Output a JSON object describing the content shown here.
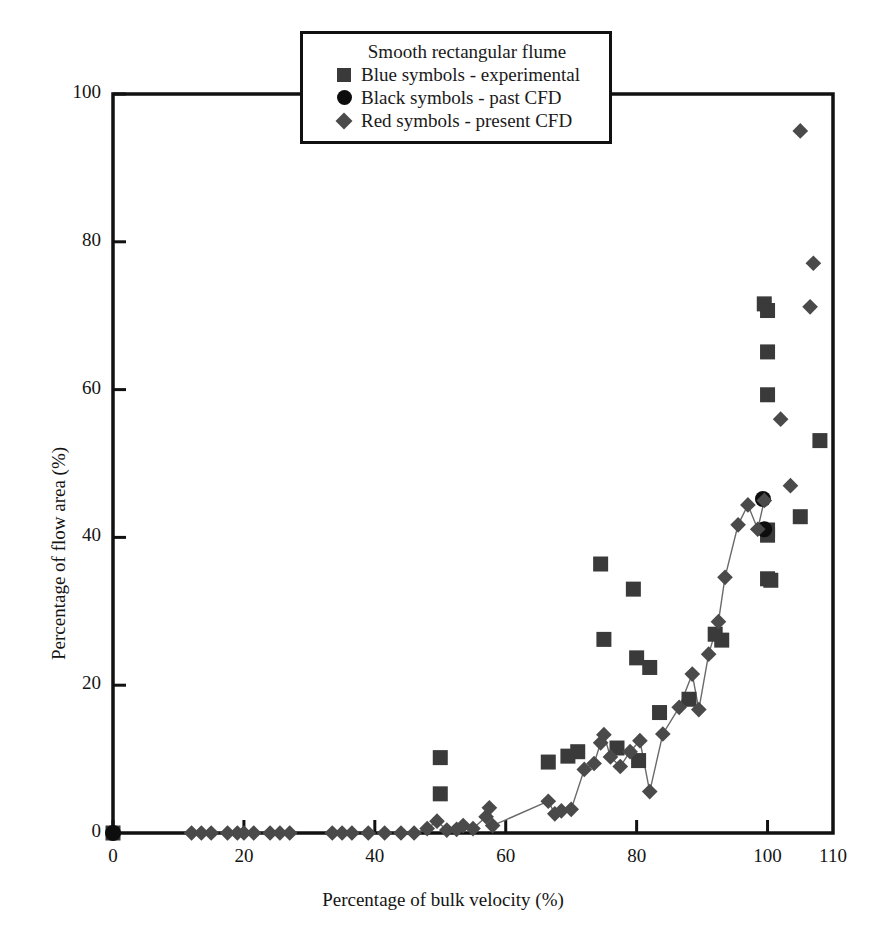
{
  "figure": {
    "background": "#ffffff",
    "width": 886,
    "height": 934
  },
  "legend": {
    "title": "Smooth rectangular flume",
    "entries": [
      {
        "marker": "square",
        "label": "Blue symbols - experimental",
        "color": "#3a3a3a"
      },
      {
        "marker": "circle",
        "label": "Black symbols - past CFD",
        "color": "#0d0d0d"
      },
      {
        "marker": "diamond",
        "label": "Red symbols - present CFD",
        "color": "#4a4a4a"
      }
    ]
  },
  "chart_data": {
    "type": "scatter",
    "title": "",
    "xlabel": "Percentage of bulk velocity (%)",
    "ylabel": "Percentage of flow area (%)",
    "xlim": [
      0,
      110
    ],
    "ylim": [
      0,
      100
    ],
    "xticks": [
      0,
      20,
      40,
      60,
      80,
      100,
      110
    ],
    "yticks": [
      0,
      20,
      40,
      60,
      80,
      100
    ],
    "xticklabels": [
      "0",
      "20",
      "40",
      "60",
      "80",
      "100",
      "110"
    ],
    "yticklabels": [
      "0",
      "20",
      "40",
      "60",
      "80",
      "100"
    ],
    "grid": false,
    "legend_position": "top-center",
    "series": [
      {
        "name": "Blue symbols - experimental",
        "marker": "square",
        "color": "#3a3a3a",
        "size": 15,
        "line": false,
        "points": [
          [
            0.0,
            0.0
          ],
          [
            50.0,
            10.2
          ],
          [
            50.0,
            5.3
          ],
          [
            66.5,
            9.6
          ],
          [
            69.5,
            10.4
          ],
          [
            71.0,
            11.0
          ],
          [
            74.5,
            36.4
          ],
          [
            75.0,
            26.2
          ],
          [
            77.0,
            11.5
          ],
          [
            79.5,
            33.0
          ],
          [
            80.0,
            23.7
          ],
          [
            80.3,
            9.8
          ],
          [
            82.0,
            22.4
          ],
          [
            83.5,
            16.3
          ],
          [
            88.0,
            18.1
          ],
          [
            92.0,
            26.9
          ],
          [
            93.0,
            26.1
          ],
          [
            99.5,
            71.6
          ],
          [
            100.0,
            70.7
          ],
          [
            100.0,
            65.1
          ],
          [
            100.0,
            59.3
          ],
          [
            100.0,
            41.0
          ],
          [
            100.0,
            40.3
          ],
          [
            100.0,
            34.4
          ],
          [
            100.5,
            34.2
          ],
          [
            105.0,
            42.8
          ],
          [
            108.0,
            53.1
          ]
        ]
      },
      {
        "name": "Black symbols - past CFD",
        "marker": "circle",
        "color": "#0d0d0d",
        "size": 16,
        "line": false,
        "points": [
          [
            0.0,
            0.0
          ],
          [
            99.3,
            45.2
          ],
          [
            99.5,
            41.1
          ]
        ]
      },
      {
        "name": "Red symbols - present CFD",
        "marker": "diamond",
        "color": "#4a4a4a",
        "size": 14,
        "line": true,
        "line_color": "#6a6a6a",
        "points": [
          [
            12.0,
            0.0
          ],
          [
            13.5,
            0.0
          ],
          [
            15.0,
            0.0
          ],
          [
            17.5,
            0.0
          ],
          [
            19.0,
            0.0
          ],
          [
            20.0,
            0.0
          ],
          [
            21.5,
            0.0
          ],
          [
            24.0,
            0.0
          ],
          [
            25.5,
            0.0
          ],
          [
            27.0,
            0.0
          ],
          [
            33.5,
            0.0
          ],
          [
            35.0,
            0.0
          ],
          [
            36.5,
            0.0
          ],
          [
            39.0,
            0.0
          ],
          [
            41.5,
            0.0
          ],
          [
            44.0,
            0.0
          ],
          [
            46.0,
            0.0
          ],
          [
            48.0,
            0.6
          ],
          [
            49.5,
            1.6
          ],
          [
            51.0,
            0.4
          ],
          [
            52.5,
            0.5
          ],
          [
            53.5,
            1.0
          ],
          [
            55.0,
            0.6
          ],
          [
            57.0,
            2.2
          ],
          [
            57.5,
            3.4
          ],
          [
            58.0,
            1.0
          ],
          [
            66.5,
            4.3
          ],
          [
            67.5,
            2.6
          ],
          [
            68.5,
            3.0
          ],
          [
            70.0,
            3.2
          ],
          [
            72.0,
            8.6
          ],
          [
            73.5,
            9.4
          ],
          [
            74.5,
            12.2
          ],
          [
            75.0,
            13.3
          ],
          [
            76.0,
            10.3
          ],
          [
            77.5,
            9.0
          ],
          [
            79.0,
            11.0
          ],
          [
            80.5,
            12.5
          ],
          [
            82.0,
            5.6
          ],
          [
            84.0,
            13.4
          ],
          [
            86.5,
            17.0
          ],
          [
            88.5,
            21.5
          ],
          [
            89.5,
            16.7
          ],
          [
            91.0,
            24.2
          ],
          [
            92.5,
            28.6
          ],
          [
            93.5,
            34.6
          ],
          [
            95.5,
            41.7
          ],
          [
            97.0,
            44.4
          ],
          [
            98.5,
            41.1
          ],
          [
            99.5,
            45.0
          ],
          [
            102.0,
            56.0
          ],
          [
            103.5,
            47.0
          ],
          [
            105.0,
            95.0
          ],
          [
            106.5,
            71.2
          ],
          [
            107.0,
            77.1
          ]
        ]
      }
    ]
  }
}
